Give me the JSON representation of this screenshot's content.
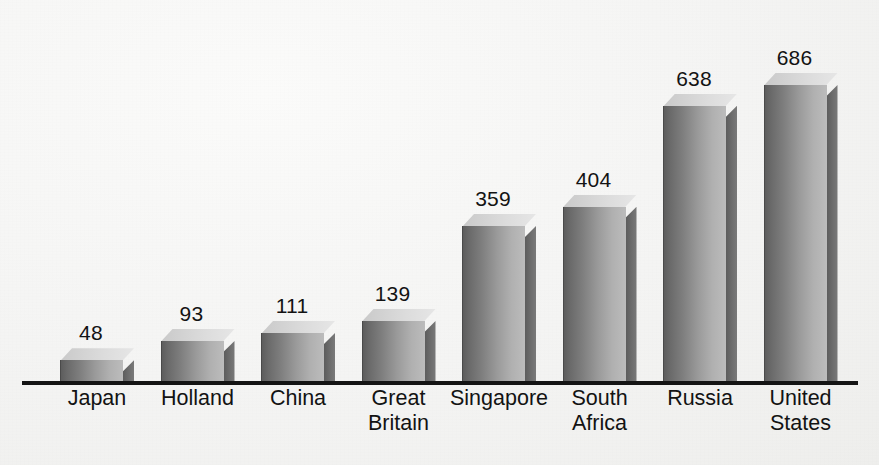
{
  "chart_data": {
    "type": "bar",
    "title": "",
    "subtitle": "",
    "xlabel": "",
    "ylabel": "",
    "grid": false,
    "legend": false,
    "style": "3d-bar",
    "axis_baseline_value": 0,
    "ylim": [
      0,
      760
    ],
    "categories": [
      "Japan",
      "Holland",
      "China",
      "Great\nBritain",
      "Singapore",
      "South\nAfrica",
      "Russia",
      "United\nStates"
    ],
    "values": [
      48,
      93,
      111,
      139,
      359,
      404,
      638,
      686
    ],
    "value_labels": [
      "48",
      "93",
      "111",
      "139",
      "359",
      "404",
      "638",
      "686"
    ],
    "colors": {
      "background": "#f4f4f3",
      "baseline": "#141414",
      "bar_front_dark": "#5d5d5d",
      "bar_front_light": "#bcbcbc",
      "bar_side": "#6a6a6a",
      "bar_top": "#d8d8d8",
      "text": "#131313"
    }
  }
}
